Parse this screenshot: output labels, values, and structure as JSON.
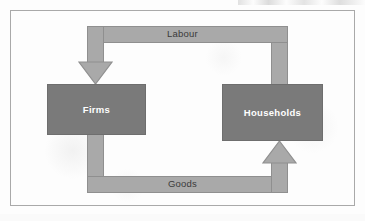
{
  "diagram": {
    "type": "circular-flow",
    "entities": [
      {
        "id": "firms",
        "label": "Firms"
      },
      {
        "id": "households",
        "label": "Households"
      }
    ],
    "flows": [
      {
        "id": "labour",
        "label": "Labour",
        "from": "households",
        "to": "firms",
        "route": "top",
        "direction": "right-to-left",
        "arrowhead": "down"
      },
      {
        "id": "goods",
        "label": "Goods",
        "from": "firms",
        "to": "households",
        "route": "bottom",
        "direction": "left-to-right",
        "arrowhead": "up"
      }
    ],
    "colors": {
      "background": "#fdfdfd",
      "frame_border": "#a9a9a9",
      "band_fill": "#a9a9a9",
      "band_border": "#8f8f8f",
      "entity_fill": "#7a7a7a",
      "entity_border": "#6e6e6e",
      "entity_text": "#ffffff",
      "band_text": "#3a3a3a"
    },
    "icons": {
      "labour_arrow": "arrow-down-icon",
      "goods_arrow": "arrow-up-icon"
    }
  }
}
